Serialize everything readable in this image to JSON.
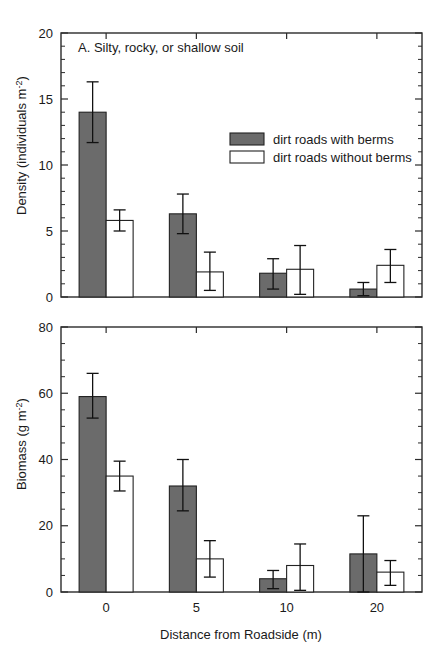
{
  "figure": {
    "axis_color": "#2b2b2b",
    "series_colors": {
      "with_berms": "#6b6b6b",
      "without_berms": "#ffffff"
    },
    "xlabel": "Distance from Roadside (m)",
    "legend": {
      "with_berms_label": "dirt roads with berms",
      "without_berms_label": "dirt roads without berms"
    }
  },
  "chart_data": [
    {
      "type": "bar",
      "panel": "A",
      "title": "A.  Silty, rocky, or shallow soil",
      "title_letter": "A.",
      "title_text": "Silty, rocky, or shallow soil",
      "categories": [
        "0",
        "5",
        "10",
        "20"
      ],
      "xlabel": "",
      "ylabel": "Density (individuals m",
      "ylabel_sup": "-2",
      "ylabel_tail": ")",
      "ylim": [
        0,
        20
      ],
      "yticks": [
        0,
        5,
        10,
        15,
        20
      ],
      "ytick_labels": [
        "0",
        "5",
        "10",
        "15",
        "20"
      ],
      "grid": false,
      "legend_position": "upper-right",
      "series": [
        {
          "name": "dirt roads with berms",
          "fill": "#6b6b6b",
          "values": [
            14.0,
            6.3,
            1.8,
            0.6
          ],
          "err_low": [
            2.3,
            1.5,
            1.2,
            0.5
          ],
          "err_high": [
            2.3,
            1.5,
            1.1,
            0.5
          ]
        },
        {
          "name": "dirt roads without berms",
          "fill": "#ffffff",
          "values": [
            5.8,
            1.9,
            2.1,
            2.4
          ],
          "err_low": [
            0.8,
            1.4,
            1.9,
            1.3
          ],
          "err_high": [
            0.8,
            1.5,
            1.8,
            1.2
          ]
        }
      ]
    },
    {
      "type": "bar",
      "panel": "B",
      "title": "",
      "categories": [
        "0",
        "5",
        "10",
        "20"
      ],
      "xlabel": "Distance from Roadside (m)",
      "ylabel": "Biomass (g m",
      "ylabel_sup": "-2",
      "ylabel_tail": ")",
      "ylim": [
        0,
        80
      ],
      "yticks": [
        0,
        20,
        40,
        60,
        80
      ],
      "ytick_labels": [
        "0",
        "20",
        "40",
        "60",
        "80"
      ],
      "grid": false,
      "legend_position": "none",
      "series": [
        {
          "name": "dirt roads with berms",
          "fill": "#6b6b6b",
          "values": [
            59.0,
            32.0,
            4.0,
            11.5
          ],
          "err_low": [
            6.5,
            7.5,
            3.0,
            11.5
          ],
          "err_high": [
            7.0,
            8.0,
            2.5,
            11.5
          ]
        },
        {
          "name": "dirt roads without berms",
          "fill": "#ffffff",
          "values": [
            35.0,
            10.0,
            8.0,
            6.0
          ],
          "err_low": [
            4.5,
            5.5,
            7.5,
            4.0
          ],
          "err_high": [
            4.5,
            5.5,
            6.5,
            3.5
          ]
        }
      ]
    }
  ]
}
